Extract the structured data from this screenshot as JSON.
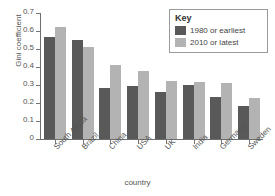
{
  "chart_data": {
    "type": "bar",
    "title": "",
    "xlabel": "country",
    "ylabel": "Gini coefficient",
    "ylim": [
      0,
      0.7
    ],
    "yticks": [
      "0",
      "0.1",
      "0.2",
      "0.3",
      "0.4",
      "0.5",
      "0.6",
      "0.7"
    ],
    "ytick_values": [
      0,
      0.1,
      0.2,
      0.3,
      0.4,
      0.5,
      0.6,
      0.7
    ],
    "grid": false,
    "legend_position": "top-right",
    "legend_title": "Key",
    "categories": [
      "South Africa",
      "Brazil",
      "China",
      "USA",
      "UK",
      "India",
      "Germany",
      "Sweden"
    ],
    "series": [
      {
        "name": "1980 or earliest",
        "color": "#595959",
        "values": [
          0.565,
          0.55,
          0.285,
          0.295,
          0.26,
          0.3,
          0.235,
          0.185
        ]
      },
      {
        "name": "2010 or latest",
        "color": "#b3b3b3",
        "values": [
          0.625,
          0.51,
          0.41,
          0.38,
          0.325,
          0.315,
          0.31,
          0.23
        ]
      }
    ]
  }
}
